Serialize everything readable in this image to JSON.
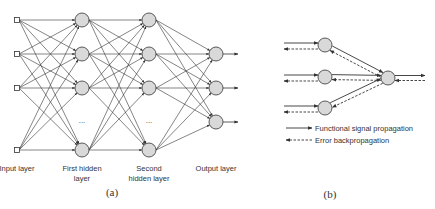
{
  "panel_a": {
    "caption": "(a)",
    "layers": [
      {
        "name": "input",
        "label_lines": [
          "Input layer"
        ],
        "node_shape": "square",
        "x": 17,
        "ys": [
          20,
          54,
          88,
          150
        ]
      },
      {
        "name": "first-hidden",
        "label_lines": [
          "First hidden",
          "layer"
        ],
        "node_shape": "circle",
        "x": 82,
        "ys": [
          20,
          54,
          88,
          150
        ],
        "ellipsis_y": 123
      },
      {
        "name": "second-hidden",
        "label_lines": [
          "Second",
          "hidden layer"
        ],
        "node_shape": "circle",
        "x": 149,
        "ys": [
          20,
          54,
          88,
          150
        ],
        "ellipsis_y": 123
      },
      {
        "name": "output",
        "label_lines": [
          "Output layer"
        ],
        "node_shape": "circle",
        "x": 216,
        "ys": [
          54,
          88,
          122
        ]
      }
    ],
    "ellipsis": "...",
    "node_fill": "#d9d9d9",
    "stroke": "#333333"
  },
  "panel_b": {
    "caption": "(b)",
    "left_nodes": [
      {
        "x": 325,
        "y": 45
      },
      {
        "x": 325,
        "y": 77
      },
      {
        "x": 325,
        "y": 108
      }
    ],
    "right_node": {
      "x": 388,
      "y": 78
    },
    "legend": [
      {
        "style": "solid",
        "label": "Functional signal propagation"
      },
      {
        "style": "dashed",
        "label": "Error backpropagation"
      }
    ]
  }
}
